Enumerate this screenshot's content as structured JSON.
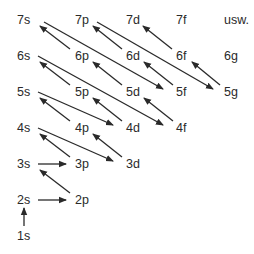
{
  "colors": {
    "text": "#2a2a2a",
    "arrow": "#2a2a2a",
    "background": "#ffffff"
  },
  "labels": [
    {
      "id": "7s",
      "text": "7s",
      "x": 17,
      "y": 14
    },
    {
      "id": "7p",
      "text": "7p",
      "x": 75,
      "y": 14
    },
    {
      "id": "7d",
      "text": "7d",
      "x": 126,
      "y": 14
    },
    {
      "id": "7f",
      "text": "7f",
      "x": 176,
      "y": 14
    },
    {
      "id": "usw",
      "text": "usw.",
      "x": 224,
      "y": 14
    },
    {
      "id": "6s",
      "text": "6s",
      "x": 17,
      "y": 50
    },
    {
      "id": "6p",
      "text": "6p",
      "x": 75,
      "y": 50
    },
    {
      "id": "6d",
      "text": "6d",
      "x": 126,
      "y": 50
    },
    {
      "id": "6f",
      "text": "6f",
      "x": 176,
      "y": 50
    },
    {
      "id": "6g",
      "text": "6g",
      "x": 224,
      "y": 50
    },
    {
      "id": "5s",
      "text": "5s",
      "x": 17,
      "y": 86
    },
    {
      "id": "5p",
      "text": "5p",
      "x": 75,
      "y": 86
    },
    {
      "id": "5d",
      "text": "5d",
      "x": 126,
      "y": 86
    },
    {
      "id": "5f",
      "text": "5f",
      "x": 176,
      "y": 86
    },
    {
      "id": "5g",
      "text": "5g",
      "x": 224,
      "y": 86
    },
    {
      "id": "4s",
      "text": "4s",
      "x": 17,
      "y": 122
    },
    {
      "id": "4p",
      "text": "4p",
      "x": 75,
      "y": 122
    },
    {
      "id": "4d",
      "text": "4d",
      "x": 126,
      "y": 122
    },
    {
      "id": "4f",
      "text": "4f",
      "x": 176,
      "y": 122
    },
    {
      "id": "3s",
      "text": "3s",
      "x": 17,
      "y": 158
    },
    {
      "id": "3p",
      "text": "3p",
      "x": 75,
      "y": 158
    },
    {
      "id": "3d",
      "text": "3d",
      "x": 126,
      "y": 158
    },
    {
      "id": "2s",
      "text": "2s",
      "x": 17,
      "y": 194
    },
    {
      "id": "2p",
      "text": "2p",
      "x": 75,
      "y": 194
    },
    {
      "id": "1s",
      "text": "1s",
      "x": 17,
      "y": 230
    }
  ],
  "arrows": [
    {
      "from": "1s",
      "to": "2s",
      "x1": 24,
      "y1": 226,
      "x2": 24,
      "y2": 208
    },
    {
      "from": "2s",
      "to": "2p",
      "x1": 38,
      "y1": 200,
      "x2": 66,
      "y2": 200
    },
    {
      "from": "2p",
      "to": "3s",
      "x1": 70,
      "y1": 193,
      "x2": 40,
      "y2": 170
    },
    {
      "from": "3s",
      "to": "3p",
      "x1": 38,
      "y1": 164,
      "x2": 66,
      "y2": 164
    },
    {
      "from": "3p",
      "to": "4s",
      "x1": 70,
      "y1": 157,
      "x2": 40,
      "y2": 134
    },
    {
      "from": "4s",
      "to": "3d",
      "x1": 38,
      "y1": 128,
      "x2": 113,
      "y2": 161
    },
    {
      "from": "3d",
      "to": "4p",
      "x1": 122,
      "y1": 157,
      "x2": 93,
      "y2": 134
    },
    {
      "from": "4p",
      "to": "5s",
      "x1": 70,
      "y1": 121,
      "x2": 40,
      "y2": 98
    },
    {
      "from": "5s",
      "to": "4d",
      "x1": 38,
      "y1": 92,
      "x2": 113,
      "y2": 125
    },
    {
      "from": "4d",
      "to": "5p",
      "x1": 122,
      "y1": 121,
      "x2": 93,
      "y2": 98
    },
    {
      "from": "5p",
      "to": "6s",
      "x1": 70,
      "y1": 85,
      "x2": 40,
      "y2": 62
    },
    {
      "from": "6s",
      "to": "4f",
      "x1": 38,
      "y1": 56,
      "x2": 163,
      "y2": 125
    },
    {
      "from": "4f",
      "to": "5d",
      "x1": 173,
      "y1": 121,
      "x2": 144,
      "y2": 98
    },
    {
      "from": "5d",
      "to": "6p",
      "x1": 122,
      "y1": 85,
      "x2": 93,
      "y2": 62
    },
    {
      "from": "6p",
      "to": "7s",
      "x1": 70,
      "y1": 49,
      "x2": 40,
      "y2": 26
    },
    {
      "from": "7s",
      "to": "5f",
      "x1": 44,
      "y1": 22,
      "x2": 163,
      "y2": 89
    },
    {
      "from": "5f",
      "to": "6d",
      "x1": 173,
      "y1": 85,
      "x2": 144,
      "y2": 62
    },
    {
      "from": "6d",
      "to": "7p",
      "x1": 122,
      "y1": 49,
      "x2": 93,
      "y2": 26
    },
    {
      "from": "7p",
      "to": "5g",
      "x1": 97,
      "y1": 22,
      "x2": 213,
      "y2": 89
    },
    {
      "from": "5g",
      "to": "6f",
      "x1": 220,
      "y1": 85,
      "x2": 192,
      "y2": 62
    },
    {
      "from": "6f",
      "to": "7d",
      "x1": 172,
      "y1": 49,
      "x2": 143,
      "y2": 26
    }
  ]
}
